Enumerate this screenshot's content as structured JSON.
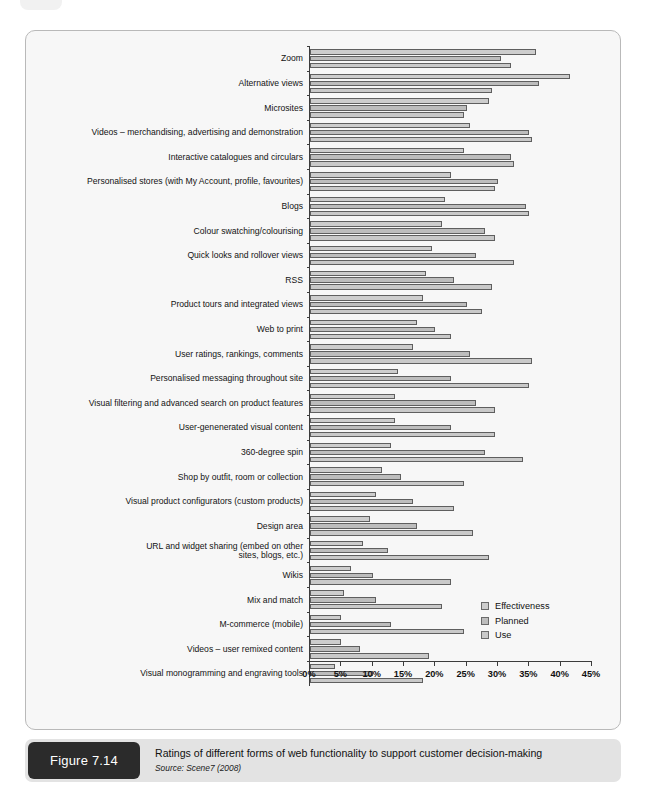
{
  "figure": {
    "badge": "Figure 7.14",
    "caption": "Ratings of different forms of web functionality to support customer decision-making",
    "source": "Source: Scene7 (2008)"
  },
  "chart_data": {
    "type": "bar",
    "orientation": "horizontal",
    "title": "Ratings of different forms of web functionality to support customer decision-making",
    "xlabel": "",
    "ylabel": "",
    "xlim": [
      0,
      45
    ],
    "xticks": [
      0,
      5,
      10,
      15,
      20,
      25,
      30,
      35,
      40,
      45
    ],
    "xticklabels": [
      "0%",
      "5%",
      "10%",
      "15%",
      "20%",
      "25%",
      "30%",
      "35%",
      "40%",
      "45%"
    ],
    "grid": false,
    "legend_position": "bottom-right",
    "categories": [
      "Zoom",
      "Alternative views",
      "Microsites",
      "Videos – merchandising, advertising and demonstration",
      "Interactive catalogues and circulars",
      "Personalised stores (with My Account, profile, favourites)",
      "Blogs",
      "Colour swatching/colourising",
      "Quick looks and rollover views",
      "RSS",
      "Product tours and integrated views",
      "Web to print",
      "User ratings, rankings, comments",
      "Personalised messaging throughout site",
      "Visual filtering and advanced search on product features",
      "User-genenerated visual content",
      "360-degree spin",
      "Shop by outfit, room or collection",
      "Visual product configurators (custom products)",
      "Design area",
      "URL and widget sharing (embed on other\nsites, blogs, etc.)",
      "Wikis",
      "Mix and match",
      "M-commerce (mobile)",
      "Videos – user remixed content",
      "Visual monogramming and engraving tools"
    ],
    "series": [
      {
        "name": "Effectiveness",
        "color": "#cdcdcd",
        "values": [
          36.0,
          41.5,
          28.5,
          25.5,
          24.5,
          22.5,
          21.5,
          21.0,
          19.5,
          18.5,
          18.0,
          17.0,
          16.5,
          14.0,
          13.5,
          13.5,
          13.0,
          11.5,
          10.5,
          9.5,
          8.5,
          6.5,
          5.5,
          5.0,
          5.0,
          4.0
        ]
      },
      {
        "name": "Planned",
        "color": "#bdbdbd",
        "values": [
          30.5,
          36.5,
          25.0,
          35.0,
          32.0,
          30.0,
          34.5,
          28.0,
          26.5,
          23.0,
          25.0,
          20.0,
          25.5,
          22.5,
          26.5,
          22.5,
          28.0,
          14.5,
          16.5,
          17.0,
          12.5,
          10.0,
          10.5,
          13.0,
          8.0,
          10.0
        ]
      },
      {
        "name": "Use",
        "color": "#c9c9c9",
        "values": [
          32.0,
          29.0,
          24.5,
          35.5,
          32.5,
          29.5,
          35.0,
          29.5,
          32.5,
          29.0,
          27.5,
          22.5,
          35.5,
          35.0,
          29.5,
          29.5,
          34.0,
          24.5,
          23.0,
          26.0,
          28.5,
          22.5,
          21.0,
          24.5,
          19.0,
          18.0
        ]
      }
    ]
  },
  "legend": {
    "items": [
      "Effectiveness",
      "Planned",
      "Use"
    ]
  }
}
